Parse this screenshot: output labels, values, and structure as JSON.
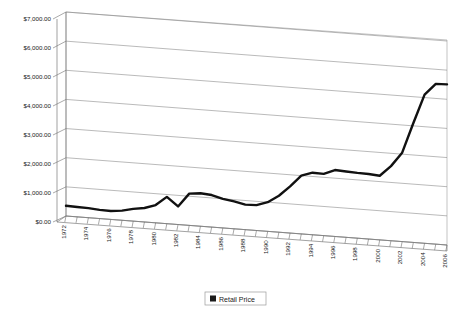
{
  "chart_data": {
    "type": "line",
    "title": "",
    "xlabel": "",
    "ylabel": "",
    "grid": true,
    "legend_position": "bottom",
    "ylim": [
      0,
      7000
    ],
    "ytick_labels": [
      "$0.00",
      "$1,000.00",
      "$2,000.00",
      "$3,000.00",
      "$4,000.00",
      "$5,000.00",
      "$6,000.00",
      "$7,000.00"
    ],
    "ytick_values": [
      0,
      1000,
      2000,
      3000,
      4000,
      5000,
      6000,
      7000
    ],
    "xtick_labels": [
      "1972",
      "1974",
      "1976",
      "1978",
      "1980",
      "1982",
      "1984",
      "1986",
      "1988",
      "1990",
      "1992",
      "1994",
      "1996",
      "1998",
      "2000",
      "2002",
      "2004",
      "2006"
    ],
    "x": [
      1972,
      1973,
      1974,
      1975,
      1976,
      1977,
      1978,
      1979,
      1980,
      1981,
      1982,
      1983,
      1984,
      1985,
      1986,
      1987,
      1988,
      1989,
      1990,
      1991,
      1992,
      1993,
      1994,
      1995,
      1996,
      1997,
      1998,
      1999,
      2000,
      2001,
      2002,
      2003,
      2004,
      2005,
      2006
    ],
    "series": [
      {
        "name": "Retail Price",
        "color": "#111111",
        "values": [
          350,
          340,
          330,
          300,
          290,
          330,
          420,
          480,
          610,
          920,
          620,
          1090,
          1130,
          1100,
          1000,
          940,
          860,
          870,
          1000,
          1250,
          1600,
          2000,
          2130,
          2120,
          2280,
          2260,
          2240,
          2230,
          2200,
          2560,
          3050,
          4100,
          5100,
          5500,
          5510
        ]
      }
    ],
    "legend": [
      {
        "label": "Retail Price",
        "color": "#1a1a1a"
      }
    ]
  }
}
